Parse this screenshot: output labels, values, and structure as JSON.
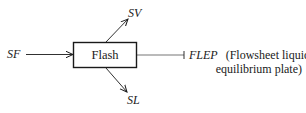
{
  "diagram": {
    "unit": {
      "label": "Flash"
    },
    "streams": {
      "feed": {
        "label": "SF",
        "direction": "in"
      },
      "vapor": {
        "label": "SV",
        "direction": "out"
      },
      "liquid": {
        "label": "SL",
        "direction": "out"
      }
    },
    "plate": {
      "label": "FLEP",
      "description_line1": "(Flowsheet liquid",
      "description_line2": "equilibrium plate)"
    },
    "colors": {
      "stroke": "#1a1a1a",
      "background": "#ffffff"
    }
  }
}
